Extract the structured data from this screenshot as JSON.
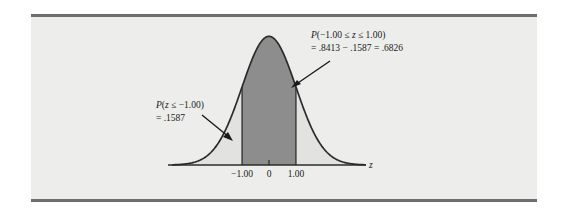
{
  "figure": {
    "background_color": "#ffffff",
    "panel_color": "#edeeec",
    "rule_color": "#6e6e6e",
    "curve_color": "#2b2b2b",
    "tail_fill_color": "#e2e3e1",
    "center_fill_color": "#8d8d8d",
    "axis_label": "z"
  },
  "annotations": {
    "upper": {
      "line1_prefix": "P",
      "line1_body": "(−1.00 ≤ ",
      "line1_var": "z",
      "line1_suffix": " ≤ 1.00)",
      "line2": "= .8413 − .1587 = .6826"
    },
    "lower": {
      "line1_prefix": "P",
      "line1_body": "(",
      "line1_var": "z",
      "line1_suffix": " ≤ −1.00)",
      "line2": "= .1587"
    }
  },
  "axis": {
    "ticks": [
      {
        "label": "−1.00",
        "value": -1.0
      },
      {
        "label": "0",
        "value": 0.0
      },
      {
        "label": "1.00",
        "value": 1.0
      }
    ]
  },
  "chart_data": {
    "type": "area",
    "title": "",
    "subtitle": "",
    "xlabel": "z",
    "ylabel": "",
    "distribution": "standard normal",
    "mean": 0.0,
    "standard_deviation": 1.0,
    "xlim": [
      -3.6,
      3.6
    ],
    "ylim": [
      0,
      0.4
    ],
    "grid": false,
    "legend": null,
    "shaded_regions": [
      {
        "name": "central-region",
        "from": -1.0,
        "to": 1.0,
        "probability": 0.6826,
        "color": "#8d8d8d",
        "label": "P(-1.00 <= z <= 1.00) = .8413 - .1587 = .6826"
      },
      {
        "name": "left-tail",
        "from": -3.6,
        "to": -1.0,
        "probability": 0.1587,
        "color": "#e2e3e1",
        "label": "P(z <= -1.00) = .1587"
      },
      {
        "name": "right-tail",
        "from": 1.0,
        "to": 3.6,
        "probability": 0.1587,
        "color": "#e2e3e1",
        "label": ""
      }
    ],
    "reference_lines": [
      {
        "x": -1.0,
        "label": "-1.00"
      },
      {
        "x": 1.0,
        "label": "1.00"
      }
    ],
    "cumulative_values": {
      "F_at_minus_1": 0.1587,
      "F_at_plus_1": 0.8413,
      "difference": 0.6826
    },
    "x": [
      -3.6,
      -3.4,
      -3.2,
      -3.0,
      -2.8,
      -2.6,
      -2.4,
      -2.2,
      -2.0,
      -1.8,
      -1.6,
      -1.4,
      -1.2,
      -1.0,
      -0.8,
      -0.6,
      -0.4,
      -0.2,
      0.0,
      0.2,
      0.4,
      0.6,
      0.8,
      1.0,
      1.2,
      1.4,
      1.6,
      1.8,
      2.0,
      2.2,
      2.4,
      2.6,
      2.8,
      3.0,
      3.2,
      3.4,
      3.6
    ],
    "y": [
      0.0006,
      0.0012,
      0.0024,
      0.0044,
      0.0079,
      0.0136,
      0.0224,
      0.0355,
      0.054,
      0.079,
      0.1109,
      0.1497,
      0.1942,
      0.242,
      0.2897,
      0.3332,
      0.3683,
      0.391,
      0.3989,
      0.391,
      0.3683,
      0.3332,
      0.2897,
      0.242,
      0.1942,
      0.1497,
      0.1109,
      0.079,
      0.054,
      0.0355,
      0.0224,
      0.0136,
      0.0079,
      0.0044,
      0.0024,
      0.0012,
      0.0006
    ]
  }
}
